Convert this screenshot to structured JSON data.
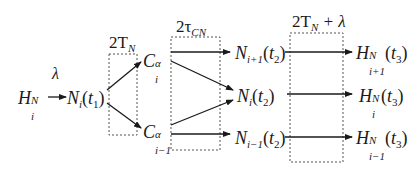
{
  "diagram": {
    "source_node": {
      "base": "H",
      "sup": "N",
      "sub": "i"
    },
    "first_arrow_label": "λ",
    "node_n_t1": {
      "base": "N",
      "sub": "i",
      "arg_base": "t",
      "arg_sub": "1"
    },
    "boxes": [
      {
        "label_main": "2T",
        "label_sub": "N",
        "label_tail": ""
      },
      {
        "label_main": "2τ",
        "label_sub": "CN",
        "label_tail": ""
      },
      {
        "label_main": "2T",
        "label_sub": "N",
        "label_tail": " + λ"
      }
    ],
    "c_nodes": [
      {
        "base": "C",
        "sup": "α",
        "sub": "i"
      },
      {
        "base": "C",
        "sup": "α",
        "sub": "i−1"
      }
    ],
    "n_t2_nodes": [
      {
        "base": "N",
        "sub": "i+1",
        "arg_base": "t",
        "arg_sub": "2"
      },
      {
        "base": "N",
        "sub": "i",
        "arg_base": "t",
        "arg_sub": "2"
      },
      {
        "base": "N",
        "sub": "i−1",
        "arg_base": "t",
        "arg_sub": "2"
      }
    ],
    "h_t3_nodes": [
      {
        "base": "H",
        "sup": "N",
        "sub": "i+1",
        "arg_base": "t",
        "arg_sub": "3"
      },
      {
        "base": "H",
        "sup": "N",
        "sub": "i",
        "arg_base": "t",
        "arg_sub": "3"
      },
      {
        "base": "H",
        "sup": "N",
        "sub": "i−1",
        "arg_base": "t",
        "arg_sub": "3"
      }
    ],
    "colors": {
      "ink": "#1a1a1a",
      "box_border": "#555555",
      "background": "#ffffff"
    }
  }
}
